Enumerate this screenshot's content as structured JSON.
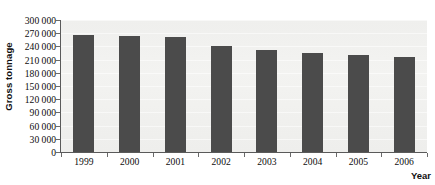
{
  "chart_data": {
    "type": "bar",
    "title": "",
    "xlabel": "Year",
    "ylabel": "Gross tonnage",
    "categories": [
      "1999",
      "2000",
      "2001",
      "2002",
      "2003",
      "2004",
      "2005",
      "2006"
    ],
    "values": [
      265000,
      263000,
      261000,
      240000,
      231000,
      226000,
      220000,
      217000
    ],
    "series": [
      {
        "name": "Gross tonnage",
        "values": [
          265000,
          263000,
          261000,
          240000,
          231000,
          226000,
          220000,
          217000
        ]
      }
    ],
    "ylim": [
      0,
      300000
    ],
    "ytick_step": 30000,
    "ytick_labels": [
      "300 000",
      "270 000",
      "240 000",
      "210 000",
      "180 000",
      "150 000",
      "120 000",
      "90 000",
      "60 000",
      "30 000",
      "0"
    ],
    "ytick_values": [
      300000,
      270000,
      240000,
      210000,
      180000,
      150000,
      120000,
      90000,
      60000,
      30000,
      0
    ],
    "grid": true,
    "legend": false,
    "legend_position": "none",
    "bar_color": "#4b4b4b",
    "plot_background": "#f1f1ef",
    "axis_color": "#5a5a5a",
    "text_color": "#0d0d0d"
  },
  "axes": {
    "y_title": "Gross tonnage",
    "x_title": "Year"
  }
}
